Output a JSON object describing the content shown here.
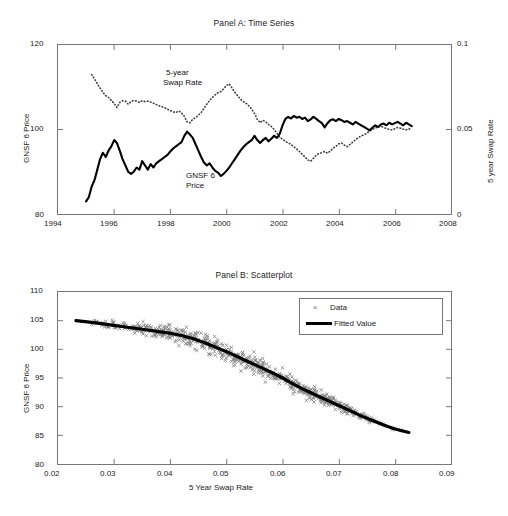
{
  "figure": {
    "background": "#ffffff",
    "series_color_price": "#000000",
    "series_color_swap": "#3a3a3a",
    "scatter_color": "#808080",
    "fitted_color": "#000000",
    "axis_color": "#777777"
  },
  "panelA": {
    "title": "Panel A: Time Series",
    "ylabel_left": "GNSF 6 Price",
    "ylabel_right": "5 year Swap Rate",
    "xticks": [
      "1994",
      "1996",
      "1998",
      "2000",
      "2002",
      "2004",
      "2006",
      "2008"
    ],
    "yticks_left": [
      "120",
      "100",
      "80"
    ],
    "yticks_right": [
      "0.1",
      "0.05",
      "0"
    ],
    "annotation_swap": "5-year",
    "annotation_swap2": "Swap Rate",
    "annotation_price": "GNSF 6",
    "annotation_price2": "Price"
  },
  "panelB": {
    "title": "Panel B: Scatterplot",
    "ylabel": "GNSF 6 Price",
    "xlabel": "5 Year Swap Rate",
    "xticks": [
      "0.02",
      "0.03",
      "0.04",
      "0.05",
      "0.06",
      "0.07",
      "0.08",
      "0.09"
    ],
    "yticks": [
      "110",
      "105",
      "100",
      "95",
      "90",
      "85",
      "80"
    ],
    "legend": {
      "data_label": "Data",
      "fitted_label": "Fitted Value",
      "data_marker": "×"
    }
  },
  "chart_data": [
    {
      "type": "line",
      "title": "Panel A: Time Series",
      "xlabel": "",
      "ylabel": "GNSF 6 Price",
      "ylabel_right": "5 year Swap Rate",
      "xlim": [
        1994,
        2008
      ],
      "ylim": [
        80,
        120
      ],
      "ylim_right": [
        0,
        0.1
      ],
      "grid": false,
      "legend": "in-plot annotations",
      "series": [
        {
          "name": "GNSF 6 Price",
          "axis": "left",
          "style": "solid-thick",
          "color": "#000000",
          "x": [
            1995.0,
            1995.1,
            1995.2,
            1995.3,
            1995.4,
            1995.5,
            1995.6,
            1995.7,
            1995.8,
            1995.9,
            1996.0,
            1996.1,
            1996.2,
            1996.3,
            1996.4,
            1996.5,
            1996.6,
            1996.7,
            1996.8,
            1996.9,
            1997.0,
            1997.1,
            1997.2,
            1997.3,
            1997.4,
            1997.5,
            1997.6,
            1997.7,
            1997.8,
            1997.9,
            1998.0,
            1998.1,
            1998.2,
            1998.3,
            1998.4,
            1998.5,
            1998.6,
            1998.7,
            1998.8,
            1998.9,
            1999.0,
            1999.1,
            1999.2,
            1999.3,
            1999.4,
            1999.5,
            1999.6,
            1999.7,
            1999.8,
            1999.9,
            2000.0,
            2000.1,
            2000.2,
            2000.3,
            2000.4,
            2000.5,
            2000.6,
            2000.7,
            2000.8,
            2000.9,
            2001.0,
            2001.1,
            2001.2,
            2001.3,
            2001.4,
            2001.5,
            2001.6,
            2001.7,
            2001.8,
            2001.9,
            2002.0,
            2002.1,
            2002.2,
            2002.3,
            2002.4,
            2002.5,
            2002.6,
            2002.7,
            2002.8,
            2002.9,
            2003.0,
            2003.1,
            2003.2,
            2003.3,
            2003.4,
            2003.5,
            2003.6,
            2003.7,
            2003.8,
            2003.9,
            2004.0,
            2004.1,
            2004.2,
            2004.3,
            2004.4,
            2004.5,
            2004.6,
            2004.7,
            2004.8,
            2004.9,
            2005.0,
            2005.1,
            2005.2,
            2005.3,
            2005.4,
            2005.5,
            2005.6,
            2005.7,
            2005.8,
            2005.9,
            2006.0,
            2006.1,
            2006.2,
            2006.3,
            2006.4,
            2006.5,
            2006.6
          ],
          "y": [
            83.0,
            84.0,
            86.5,
            88.0,
            90.5,
            93.0,
            94.5,
            93.5,
            95.0,
            96.0,
            97.5,
            96.8,
            95.0,
            93.0,
            91.5,
            90.0,
            89.5,
            90.0,
            91.0,
            90.5,
            92.5,
            91.5,
            90.5,
            91.8,
            91.0,
            92.0,
            92.5,
            93.0,
            93.5,
            94.0,
            94.8,
            95.5,
            96.0,
            96.5,
            97.0,
            98.5,
            99.5,
            98.8,
            98.0,
            96.5,
            95.0,
            93.5,
            92.2,
            91.5,
            92.0,
            91.0,
            90.2,
            89.8,
            89.0,
            89.5,
            90.2,
            91.0,
            92.0,
            93.0,
            94.0,
            95.0,
            95.8,
            96.5,
            97.0,
            97.5,
            98.5,
            97.5,
            96.8,
            97.5,
            98.0,
            97.2,
            97.8,
            98.5,
            98.0,
            99.0,
            101.0,
            102.5,
            103.0,
            102.6,
            103.2,
            102.8,
            103.0,
            102.5,
            102.8,
            102.0,
            102.4,
            103.0,
            102.5,
            102.0,
            101.5,
            100.5,
            101.5,
            102.2,
            102.4,
            102.0,
            102.5,
            102.2,
            101.8,
            102.0,
            101.6,
            101.2,
            101.8,
            101.4,
            101.0,
            100.6,
            100.2,
            99.8,
            100.4,
            101.0,
            100.6,
            101.2,
            101.4,
            101.0,
            101.6,
            101.2,
            101.5,
            101.8,
            101.4,
            101.0,
            101.6,
            101.2,
            100.8
          ]
        },
        {
          "name": "5-year Swap Rate",
          "axis": "right",
          "style": "dotted",
          "color": "#3a3a3a",
          "x": [
            1995.2,
            1995.3,
            1995.4,
            1995.5,
            1995.6,
            1995.7,
            1995.8,
            1995.9,
            1996.0,
            1996.1,
            1996.2,
            1996.3,
            1996.4,
            1996.5,
            1996.6,
            1996.7,
            1996.8,
            1996.9,
            1997.0,
            1997.1,
            1997.2,
            1997.3,
            1997.4,
            1997.5,
            1997.6,
            1997.7,
            1997.8,
            1997.9,
            1998.0,
            1998.1,
            1998.2,
            1998.3,
            1998.4,
            1998.5,
            1998.6,
            1998.7,
            1998.8,
            1998.9,
            1999.0,
            1999.1,
            1999.2,
            1999.3,
            1999.4,
            1999.5,
            1999.6,
            1999.7,
            1999.8,
            1999.9,
            2000.0,
            2000.1,
            2000.2,
            2000.3,
            2000.4,
            2000.5,
            2000.6,
            2000.7,
            2000.8,
            2000.9,
            2001.0,
            2001.1,
            2001.2,
            2001.3,
            2001.4,
            2001.5,
            2001.6,
            2001.7,
            2001.8,
            2001.9,
            2002.0,
            2002.1,
            2002.2,
            2002.3,
            2002.4,
            2002.5,
            2002.6,
            2002.7,
            2002.8,
            2002.9,
            2003.0,
            2003.1,
            2003.2,
            2003.3,
            2003.4,
            2003.5,
            2003.6,
            2003.7,
            2003.8,
            2003.9,
            2004.0,
            2004.1,
            2004.2,
            2004.3,
            2004.4,
            2004.5,
            2004.6,
            2004.7,
            2004.8,
            2004.9,
            2005.0,
            2005.1,
            2005.2,
            2005.3,
            2005.4,
            2005.5,
            2005.6,
            2005.7,
            2005.8,
            2005.9,
            2006.0,
            2006.1,
            2006.2,
            2006.3,
            2006.4,
            2006.5,
            2006.6
          ],
          "y": [
            0.0825,
            0.08,
            0.077,
            0.0745,
            0.072,
            0.07,
            0.069,
            0.0672,
            0.0655,
            0.063,
            0.066,
            0.067,
            0.0668,
            0.065,
            0.0665,
            0.0672,
            0.0668,
            0.066,
            0.067,
            0.0665,
            0.0668,
            0.0662,
            0.0655,
            0.0648,
            0.064,
            0.0635,
            0.0628,
            0.062,
            0.0612,
            0.0605,
            0.06,
            0.061,
            0.0598,
            0.0578,
            0.0545,
            0.054,
            0.056,
            0.057,
            0.0585,
            0.06,
            0.0625,
            0.065,
            0.0672,
            0.069,
            0.0705,
            0.0718,
            0.0725,
            0.074,
            0.076,
            0.077,
            0.0745,
            0.072,
            0.07,
            0.068,
            0.0665,
            0.0655,
            0.064,
            0.062,
            0.0595,
            0.056,
            0.054,
            0.0555,
            0.0545,
            0.053,
            0.0518,
            0.05,
            0.0478,
            0.0455,
            0.0442,
            0.043,
            0.042,
            0.0412,
            0.0398,
            0.0385,
            0.037,
            0.0352,
            0.0338,
            0.032,
            0.0312,
            0.033,
            0.0348,
            0.0358,
            0.0362,
            0.037,
            0.036,
            0.0372,
            0.039,
            0.04,
            0.0415,
            0.042,
            0.0408,
            0.0398,
            0.0412,
            0.0425,
            0.044,
            0.0452,
            0.0462,
            0.0468,
            0.0478,
            0.049,
            0.05,
            0.0508,
            0.0515,
            0.052,
            0.0512,
            0.0506,
            0.05,
            0.0498,
            0.0505,
            0.0512,
            0.0508,
            0.0502,
            0.0498,
            0.0504,
            0.05
          ]
        }
      ]
    },
    {
      "type": "scatter",
      "title": "Panel B: Scatterplot",
      "xlabel": "5 Year Swap Rate",
      "ylabel": "GNSF 6 Price",
      "xlim": [
        0.02,
        0.09
      ],
      "ylim": [
        80,
        110
      ],
      "grid": false,
      "legend_position": "upper-right",
      "legend_entries": [
        "Data",
        "Fitted Value"
      ],
      "series": [
        {
          "name": "Fitted Value",
          "type": "line",
          "color": "#000000",
          "x": [
            0.0232,
            0.026,
            0.029,
            0.032,
            0.035,
            0.038,
            0.04,
            0.042,
            0.044,
            0.046,
            0.048,
            0.05,
            0.052,
            0.054,
            0.056,
            0.058,
            0.06,
            0.062,
            0.064,
            0.066,
            0.068,
            0.07,
            0.072,
            0.074,
            0.076,
            0.078,
            0.08,
            0.0825
          ],
          "y": [
            105.0,
            104.7,
            104.3,
            103.9,
            103.5,
            103.1,
            102.8,
            102.4,
            101.9,
            101.2,
            100.4,
            99.6,
            98.7,
            97.8,
            96.9,
            96.0,
            95.0,
            93.9,
            92.9,
            92.0,
            91.1,
            90.2,
            89.3,
            88.4,
            87.6,
            86.8,
            86.1,
            85.5
          ]
        },
        {
          "name": "Data",
          "type": "scatter",
          "marker": "x",
          "color": "#808080",
          "n_points": 600,
          "x_range": [
            0.0232,
            0.0828
          ],
          "y_scatter_sd": 0.9,
          "note": "points scattered about the fitted curve; spread widens mid-range"
        }
      ]
    }
  ]
}
